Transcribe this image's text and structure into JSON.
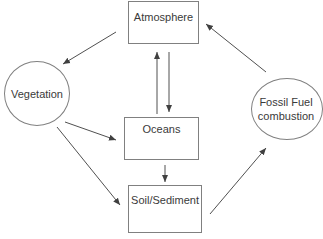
{
  "diagram": {
    "type": "flow",
    "nodes": [
      {
        "id": "atmosphere",
        "label": "Atmosphere",
        "shape": "rectangle"
      },
      {
        "id": "vegetation",
        "label": "Vegetation",
        "shape": "circle"
      },
      {
        "id": "oceans",
        "label": "Oceans",
        "shape": "rectangle"
      },
      {
        "id": "soil",
        "label": "Soil/Sediment",
        "shape": "rectangle"
      },
      {
        "id": "fossil",
        "label": "Fossil Fuel combustion",
        "label_lines": [
          "Fossil Fuel",
          "combustion"
        ],
        "shape": "circle"
      }
    ],
    "edges": [
      {
        "from": "atmosphere",
        "to": "vegetation"
      },
      {
        "from": "fossil",
        "to": "atmosphere"
      },
      {
        "from": "oceans",
        "to": "atmosphere"
      },
      {
        "from": "atmosphere",
        "to": "oceans"
      },
      {
        "from": "vegetation",
        "to": "oceans"
      },
      {
        "from": "vegetation",
        "to": "soil"
      },
      {
        "from": "oceans",
        "to": "soil"
      },
      {
        "from": "soil",
        "to": "fossil"
      }
    ],
    "colors": {
      "stroke": "#808080",
      "text": "#3a3a3a",
      "arrow": "#404040"
    }
  }
}
